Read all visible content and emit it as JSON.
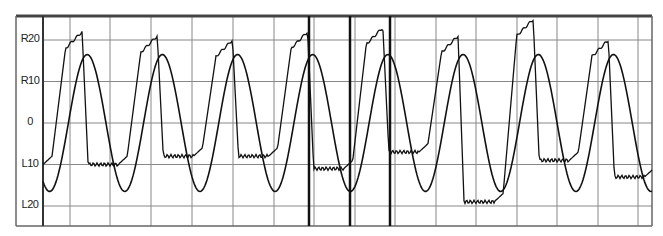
{
  "chart_data": {
    "type": "line",
    "title": "",
    "xlabel": "",
    "ylabel": "",
    "y_tick_labels": [
      "R20",
      "R10",
      "0",
      "L10",
      "L20"
    ],
    "y_tick_values": [
      20,
      10,
      0,
      -10,
      -20
    ],
    "ylim": [
      -24,
      26
    ],
    "grid": true,
    "legend": null,
    "series": [
      {
        "name": "sinusoidal target",
        "description": "smooth sine wave, amplitude ~±16.5, ~8 cycles",
        "amplitude": 16.5,
        "cycles": 8.1
      },
      {
        "name": "tracking response",
        "description": "stepped/lagging waveform reaching ~R21 peaks and ~L9 to L12 plateaus",
        "peaks": [
          22,
          21,
          20,
          22,
          23,
          21,
          25,
          20
        ],
        "troughs": [
          -10,
          -8,
          -8,
          -11,
          -7,
          -19,
          -9,
          -13
        ]
      }
    ],
    "markers": [
      {
        "type": "vertical-line",
        "x_px": 309
      },
      {
        "type": "vertical-line",
        "x_px": 350
      },
      {
        "type": "vertical-line",
        "x_px": 390
      }
    ]
  },
  "axis": {
    "labels": [
      "R20",
      "R10",
      "0",
      "L10",
      "L20"
    ]
  }
}
